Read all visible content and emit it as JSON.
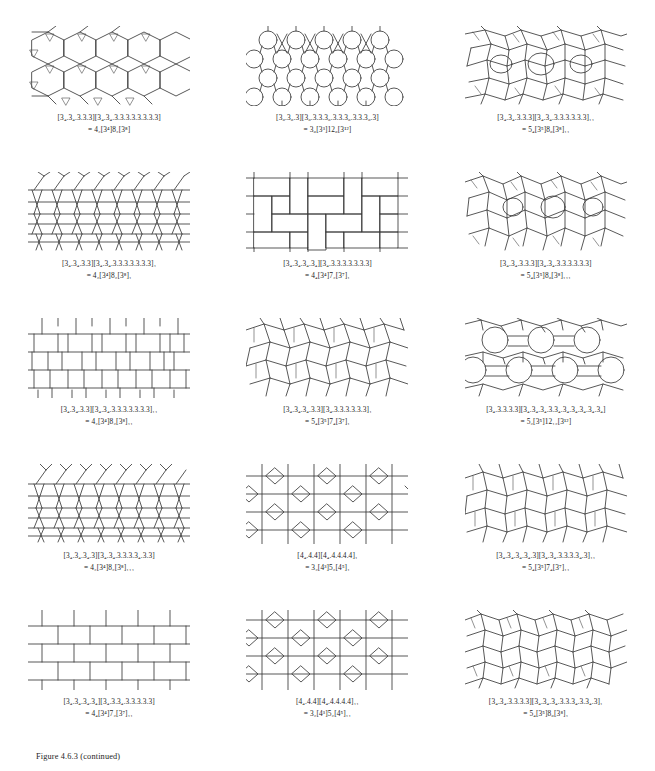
{
  "document": {
    "figure_label": "Figure 4.6.3 (continued)",
    "page_kind": "tilings-and-patterns-figure-page",
    "grid": {
      "columns": 3,
      "rows": 5
    }
  },
  "tiles": [
    {
      "id": "r1c1",
      "pattern": "hexagons-with-small-triangles",
      "symbol_line1": "[3₄.3₄.3.3.3][3₄.3₄.3.3.3.3.3.3.3.3]",
      "symbol_line2": "= 4₂[3⁴]8₂[3⁸]",
      "sym_l1_parts": [
        "[3",
        "4",
        ".3",
        "4",
        ".3.3.3][3",
        "4",
        ".3",
        "4",
        ".3.3.3.3.3.3.3.3]"
      ],
      "sym_l2_parts": [
        "= 4",
        "2",
        "[3",
        "4",
        "]8",
        "2",
        "[3",
        "8",
        "]"
      ]
    },
    {
      "id": "r1c2",
      "pattern": "hexagons-and-triangles-dodecagonal",
      "symbol_line1": "[3₆.3₆.3][3₆.3.3.3₆.3.3.3₆.3.3.3₆.3]",
      "symbol_line2": "= 3₆[3³]12₆[3¹²]"
    },
    {
      "id": "r1c3",
      "pattern": "mixed-pentagon-octagon-II",
      "symbol_line1": "[3₄.3₄.3.3.3][3₄.3₄.3.3.3.3.3.3]₁₁",
      "symbol_line2": "= 5₄[3⁵]8₆[3⁸]₁₁"
    },
    {
      "id": "r2c1",
      "pattern": "elongated-hexagons-rows-I",
      "symbol_line1": "[3₄.3₄.3.3][3₄.3₄.3.3.3.3.3.3.3]₁",
      "symbol_line2": "= 4₂[3⁴]8₂[3⁸]₁"
    },
    {
      "id": "r2c2",
      "pattern": "rectangular-brick-blocks",
      "symbol_line1": "[3₄.3₄.3₄.3₄][3₄.3.3.3.3.3.3.3]",
      "symbol_line2": "= 4₄[3⁴]7₂[3⁷]₁"
    },
    {
      "id": "r2c3",
      "pattern": "irregular-pentagons-octagons-III",
      "symbol_line1": "[3₄.3₄.3.3.3][3₄.3₄.3.3.3.3.3.3]",
      "symbol_line2": "= 5₄[3⁵]8₆[3⁸]₁₁₁"
    },
    {
      "id": "r3c1",
      "pattern": "rectangular-blocks-with-stems-II",
      "symbol_line1": "[3₄.3₄.3.3][3₄.3₄.3.3.3.3.3.3.3]₁₁",
      "symbol_line2": "= 4₂[3⁴]8₂[3⁸]₁₁"
    },
    {
      "id": "r3c2",
      "pattern": "pentagons-heptagons-I",
      "symbol_line1": "[3₄.3₄.3₄.3.3][3₄.3.3.3.3.3.3]₁",
      "symbol_line2": "= 5₄[3⁵]7₄[3⁷]₁"
    },
    {
      "id": "r3c3",
      "pattern": "pentagons-dodecagons",
      "symbol_line1": "[3₄.3.3.3.3][3₄.3₄.3₄.3.3₄.3₄.3₄.3₄.3₄.3₄]",
      "symbol_line2": "= 5₂[3⁵]12₁₂[3¹²]"
    },
    {
      "id": "r4c1",
      "pattern": "elongated-hexagons-rows-III",
      "symbol_line1": "[3₄.3₄.3₄.3][3₄.3₄.3.3.3.3₄.3.3]",
      "symbol_line2": "= 4₂[3⁴]8₂[3⁸]₁₁₁"
    },
    {
      "id": "r4c2",
      "pattern": "square-grid-with-diamonds-I",
      "symbol_line1": "[4₄.4.4][4₄.4.4.4.4]₁",
      "symbol_line2": "= 3₂[4³]5₂[4⁵]₁"
    },
    {
      "id": "r4c3",
      "pattern": "pentagons-heptagons-II",
      "symbol_line1": "[3₄.3₄.3₄.3₄.3][3₄.3₄.3.3.3.3₄.3]₁₁",
      "symbol_line2": "= 5₄[3⁵]7₄[3⁷]₁₁"
    },
    {
      "id": "r5c1",
      "pattern": "brick-rows-with-stems",
      "symbol_line1": "[3₄.3₄.3₄.3₄][3₄.3.3₄.3.3.3.3.3]",
      "symbol_line2": "= 4₄[3⁴]7₂[3⁷]₁₁"
    },
    {
      "id": "r5c2",
      "pattern": "square-grid-with-diamonds-II",
      "symbol_line1": "[4₄.4.4][4₄.4.4.4.4]₁₁",
      "symbol_line2": "= 3₂[4³]5₂[4⁵]₁₁"
    },
    {
      "id": "r5c3",
      "pattern": "pentagon-octagon-zigzag-I",
      "symbol_line1": "[3₄.3₄.3.3.3.3][3₄.3₄.3₄.3.3.3₄.3.3₄.3]₁",
      "symbol_line2": "= 5₄[3⁵]8₆[3⁸]₁"
    }
  ],
  "colors": {
    "ink": "#3a3a3a",
    "text": "#1d1d1d",
    "paper": "#ffffff"
  }
}
